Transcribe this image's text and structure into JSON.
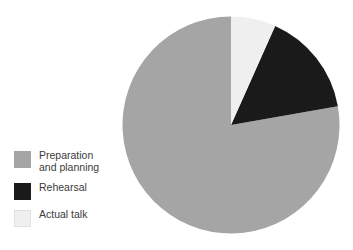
{
  "chart_data": {
    "type": "pie",
    "title": "",
    "labels": [
      "Preparation and planning",
      "Rehearsal",
      "Actual talk"
    ],
    "values": [
      77.8,
      15.6,
      6.6
    ],
    "units": "percent",
    "colors": [
      "#a5a5a5",
      "#1a1a1a",
      "#efefef"
    ],
    "start_angle_deg": 0,
    "direction": "clockwise",
    "slices": [
      {
        "label": "Preparation and planning",
        "value": 77.8,
        "color": "#a5a5a5",
        "start_deg": 80,
        "end_deg": 360
      },
      {
        "label": "Rehearsal",
        "value": 15.6,
        "color": "#1a1a1a",
        "start_deg": 24,
        "end_deg": 80
      },
      {
        "label": "Actual talk",
        "value": 6.6,
        "color": "#efefef",
        "start_deg": 0,
        "end_deg": 24
      }
    ],
    "legend": {
      "position": "left",
      "entries": [
        {
          "label": "Preparation\nand planning",
          "color": "#a5a5a5"
        },
        {
          "label": "Rehearsal",
          "color": "#1a1a1a"
        },
        {
          "label": "Actual talk",
          "color": "#efefef"
        }
      ]
    },
    "xlabel": "",
    "ylabel": "",
    "grid": false
  },
  "legend": {
    "item0": {
      "label": "Preparation\nand planning",
      "color": "#a5a5a5",
      "swatch_name": "preparation-and-planning"
    },
    "item1": {
      "label": "Rehearsal",
      "color": "#1a1a1a",
      "swatch_name": "rehearsal"
    },
    "item2": {
      "label": "Actual talk",
      "color": "#efefef",
      "swatch_name": "actual-talk"
    }
  }
}
